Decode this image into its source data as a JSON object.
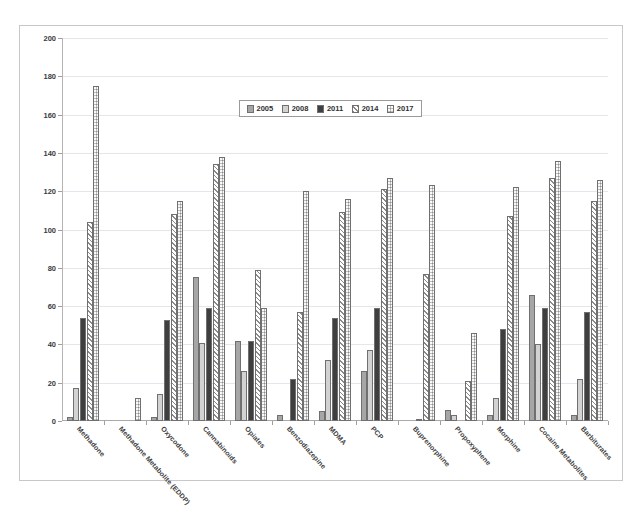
{
  "chart_data": {
    "type": "bar",
    "title": "",
    "xlabel": "",
    "ylabel": "",
    "ylim": [
      0,
      200
    ],
    "ytick_step": 20,
    "yticks": [
      0,
      20,
      40,
      60,
      80,
      100,
      120,
      140,
      160,
      180,
      200
    ],
    "grid": true,
    "legend_position": "top-center",
    "categories": [
      "Methadone",
      "Methadone Metabolite (EDDP)",
      "Oxycodone",
      "Cannabinoids",
      "Opiates",
      "Benzodiazepine",
      "MDMA",
      "PCP",
      "Buprenorphine",
      "Propoxyphene",
      "Morphine",
      "Cocaine Metabolites",
      "Barbiturates"
    ],
    "series": [
      {
        "name": "2005",
        "pattern": "solid-gray",
        "color": "#a6a6a6",
        "values": [
          2,
          0,
          2,
          75,
          42,
          3,
          5,
          26,
          0,
          6,
          3,
          66,
          3
        ]
      },
      {
        "name": "2008",
        "pattern": "light-gray",
        "color": "#d2d2d2",
        "values": [
          17,
          0,
          14,
          41,
          26,
          0,
          32,
          37,
          0,
          3,
          12,
          40,
          22
        ]
      },
      {
        "name": "2011",
        "pattern": "dark-dotted",
        "color": "#3f3f3f",
        "values": [
          54,
          0,
          53,
          59,
          42,
          22,
          54,
          59,
          1,
          0,
          48,
          59,
          57
        ]
      },
      {
        "name": "2014",
        "pattern": "diagonal-hatch",
        "color": "#ffffff",
        "values": [
          104,
          0,
          108,
          134,
          79,
          57,
          109,
          121,
          77,
          21,
          107,
          127,
          115
        ]
      },
      {
        "name": "2017",
        "pattern": "dotted-checker",
        "color": "#bdbdbd",
        "values": [
          175,
          12,
          115,
          138,
          59,
          120,
          116,
          127,
          123,
          46,
          122,
          136,
          126
        ]
      }
    ]
  },
  "legend": {
    "items": [
      {
        "label": "2005"
      },
      {
        "label": "2008"
      },
      {
        "label": "2011"
      },
      {
        "label": "2014"
      },
      {
        "label": "2017"
      }
    ]
  }
}
